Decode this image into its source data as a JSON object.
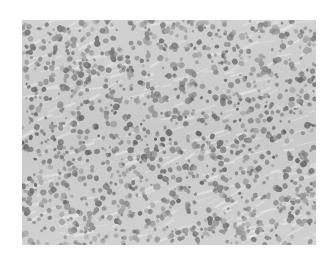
{
  "image": {
    "subject": "histology micrograph of densely packed cells",
    "tone": "grayscale",
    "bbox": {
      "x": 22,
      "y": 20,
      "width": 294,
      "height": 225
    },
    "colors": {
      "page_background": "#ffffff",
      "tissue_background": "#c9c9c9",
      "stroma_light": "#dcdcdc",
      "nucleus_dark": "#6e6e6e",
      "nucleus_mid": "#8c8c8c"
    },
    "cell_count_estimate": 1400,
    "seed": 7
  }
}
